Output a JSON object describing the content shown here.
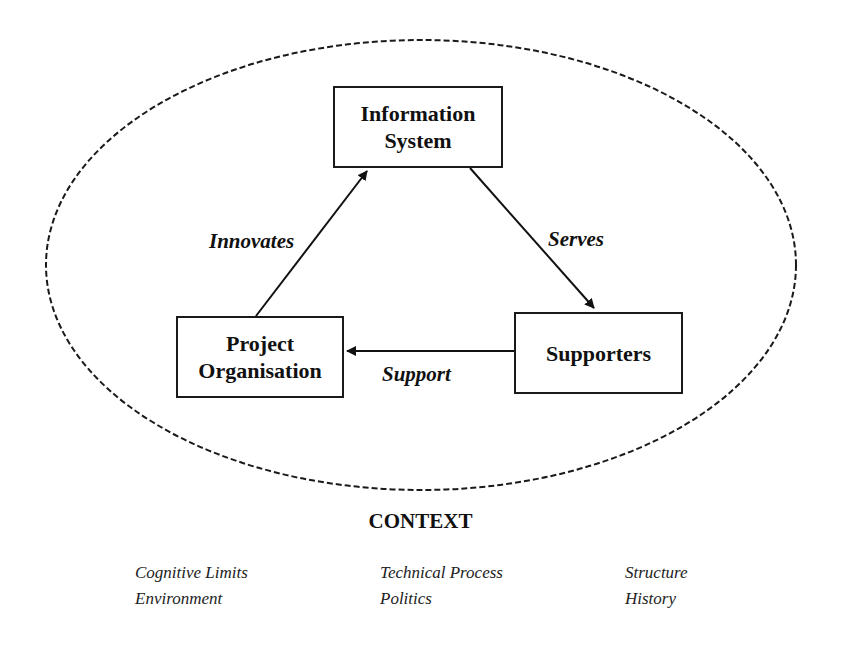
{
  "diagram": {
    "nodes": [
      {
        "id": "information-system",
        "lines": [
          "Information",
          "System"
        ]
      },
      {
        "id": "project-organisation",
        "lines": [
          "Project",
          "Organisation"
        ]
      },
      {
        "id": "supporters",
        "lines": [
          "Supporters"
        ]
      }
    ],
    "edges": [
      {
        "from": "project-organisation",
        "to": "information-system",
        "label": "Innovates"
      },
      {
        "from": "information-system",
        "to": "supporters",
        "label": "Serves"
      },
      {
        "from": "supporters",
        "to": "project-organisation",
        "label": "Support"
      }
    ],
    "boundary": {
      "style": "dashed-ellipse"
    }
  },
  "context": {
    "title": "CONTEXT",
    "columns": [
      [
        "Cognitive Limits",
        "Environment"
      ],
      [
        "Technical Process",
        "Politics"
      ],
      [
        "Structure",
        "History"
      ]
    ]
  }
}
